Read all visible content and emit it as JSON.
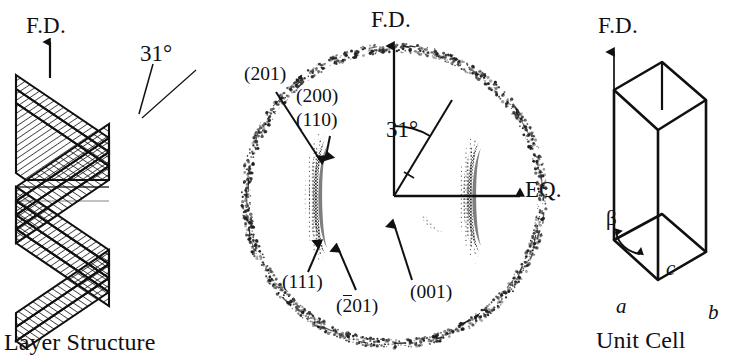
{
  "figure": {
    "panels": [
      {
        "id": "layer-structure",
        "caption": "Layer Structure",
        "axis_label": "F.D.",
        "angle_label": "31°"
      },
      {
        "id": "diffraction-pattern",
        "axis_label_vertical": "F.D.",
        "axis_label_horizontal": "EQ.",
        "angle_label": "31°",
        "reflections": [
          {
            "name": "reflection-201",
            "label": "(201)",
            "overbar": false
          },
          {
            "name": "reflection-200",
            "label": "(200)",
            "overbar": false
          },
          {
            "name": "reflection-110",
            "label": "(110)",
            "overbar": false
          },
          {
            "name": "reflection-111",
            "label": "(111)",
            "overbar": false
          },
          {
            "name": "reflection-2bar01",
            "label_prefix": "(",
            "label_overbar": "2",
            "label_suffix": "01)",
            "overbar": true
          },
          {
            "name": "reflection-001",
            "label": "(001)",
            "overbar": false
          }
        ]
      },
      {
        "id": "unit-cell",
        "caption": "Unit Cell",
        "axis_label": "F.D.",
        "cell_axes": [
          {
            "name": "axis-a",
            "label": "a"
          },
          {
            "name": "axis-b",
            "label": "b"
          },
          {
            "name": "axis-c",
            "label": "c"
          }
        ],
        "angle_label": "β"
      }
    ],
    "colors": {
      "ink": "#101010",
      "background": "#ffffff",
      "hatch": "#1a1a1a"
    }
  }
}
